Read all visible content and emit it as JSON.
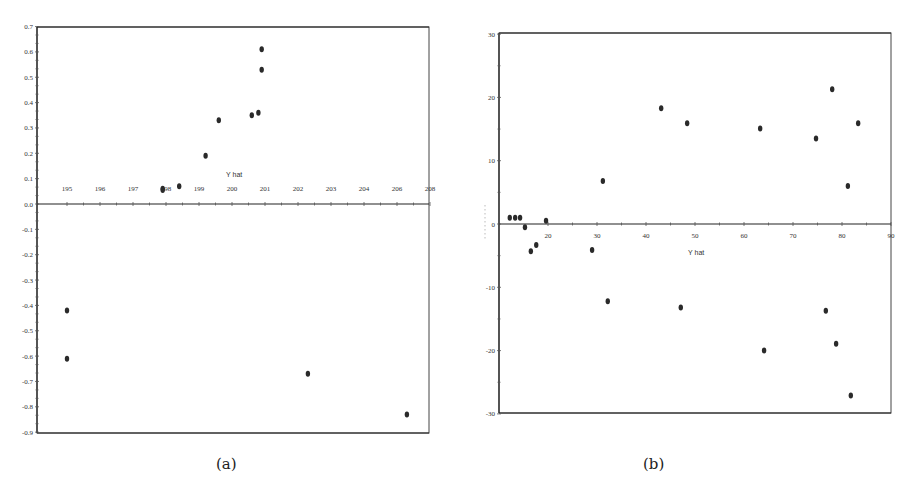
{
  "captions": {
    "a": "(a)",
    "b": "(b)"
  },
  "chart_data": [
    {
      "type": "scatter",
      "panel": "(a)",
      "title": "",
      "xlabel": "Y hat",
      "ylabel": "",
      "xticks": [
        "195",
        "196",
        "197",
        "198",
        "199",
        "200",
        "201",
        "202",
        "203",
        "204",
        "206",
        "208"
      ],
      "yticks": [
        "0.7",
        "0.6",
        "0.5",
        "0.4",
        "0.3",
        "0.2",
        "0.1",
        "0.0",
        "-0.1",
        "-0.2",
        "-0.3",
        "-0.4",
        "-0.5",
        "-0.6",
        "-0.7",
        "-0.8",
        "-0.9"
      ],
      "xlim": [
        194.1,
        206
      ],
      "ylim": [
        -0.9,
        0.7
      ],
      "grid": false,
      "points": [
        {
          "x": 197.9,
          "y": 0.06
        },
        {
          "x": 197.9,
          "y": 0.055
        },
        {
          "x": 198.4,
          "y": 0.07
        },
        {
          "x": 199.2,
          "y": 0.19
        },
        {
          "x": 199.6,
          "y": 0.33
        },
        {
          "x": 200.6,
          "y": 0.35
        },
        {
          "x": 200.8,
          "y": 0.36
        },
        {
          "x": 200.9,
          "y": 0.53
        },
        {
          "x": 200.9,
          "y": 0.61
        },
        {
          "x": 195.0,
          "y": -0.42
        },
        {
          "x": 195.0,
          "y": -0.61
        },
        {
          "x": 202.3,
          "y": -0.67
        },
        {
          "x": 205.3,
          "y": -0.83
        }
      ]
    },
    {
      "type": "scatter",
      "panel": "(b)",
      "title": "",
      "xlabel": "Y hat",
      "ylabel": "",
      "xticks": [
        "20",
        "30",
        "40",
        "50",
        "60",
        "70",
        "80",
        "90"
      ],
      "yticks": [
        "30",
        "20",
        "10",
        "0",
        "-10",
        "-20",
        "-30"
      ],
      "xlim": [
        10,
        90
      ],
      "ylim": [
        -30,
        30
      ],
      "grid": false,
      "points": [
        {
          "x": 12.2,
          "y": 1.0
        },
        {
          "x": 13.3,
          "y": 1.0
        },
        {
          "x": 14.3,
          "y": 1.0
        },
        {
          "x": 15.3,
          "y": -0.5
        },
        {
          "x": 16.5,
          "y": -4.3
        },
        {
          "x": 17.6,
          "y": -3.3
        },
        {
          "x": 19.6,
          "y": 0.5
        },
        {
          "x": 29.0,
          "y": -4.1
        },
        {
          "x": 31.2,
          "y": 6.8
        },
        {
          "x": 32.2,
          "y": -12.2
        },
        {
          "x": 43.1,
          "y": 18.3
        },
        {
          "x": 47.1,
          "y": -13.2
        },
        {
          "x": 48.4,
          "y": 15.9
        },
        {
          "x": 63.3,
          "y": 15.1
        },
        {
          "x": 64.1,
          "y": -20.0
        },
        {
          "x": 74.7,
          "y": 13.5
        },
        {
          "x": 76.7,
          "y": -13.7
        },
        {
          "x": 78.0,
          "y": 21.3
        },
        {
          "x": 78.8,
          "y": -18.9
        },
        {
          "x": 81.2,
          "y": 6.0
        },
        {
          "x": 81.8,
          "y": -27.1
        },
        {
          "x": 83.3,
          "y": 15.9
        }
      ]
    }
  ],
  "layout": {
    "a": {
      "left": 37,
      "right": 429,
      "top": 27,
      "bottom": 433,
      "zeroY": 204,
      "x0": 67,
      "x0val": 195,
      "pxPerX": 33,
      "pxPerY": 253.5
    },
    "b": {
      "left": 499,
      "right": 891,
      "top": 33,
      "bottom": 413,
      "zeroY": 224,
      "x0": 548,
      "x0val": 20,
      "pxPerX": 4.9,
      "pxPerY": 6.33
    }
  },
  "colors": {
    "point": "#2a2a2a",
    "axis": "#222222"
  }
}
